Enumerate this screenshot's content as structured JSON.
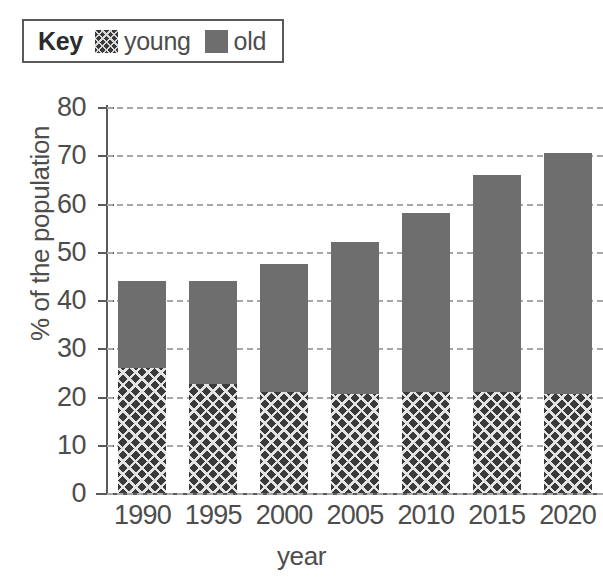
{
  "legend": {
    "title": "Key",
    "entries": [
      {
        "label": "young",
        "swatch": "hatched-swatch",
        "color": "#3a3a3a"
      },
      {
        "label": "old",
        "swatch": "solid-swatch",
        "color": "#6e6e6e"
      }
    ]
  },
  "chart_data": {
    "type": "bar",
    "stacked": true,
    "title": "",
    "xlabel": "year",
    "ylabel": "% of the population",
    "categories": [
      "1990",
      "1995",
      "2000",
      "2005",
      "2010",
      "2015",
      "2020"
    ],
    "series": [
      {
        "name": "young",
        "values": [
          26,
          22.5,
          21,
          20.5,
          21,
          21,
          20.5
        ],
        "color": "#3a3a3a"
      },
      {
        "name": "old",
        "values": [
          18,
          21.5,
          26.5,
          31.5,
          37,
          45,
          50
        ],
        "color": "#6e6e6e"
      }
    ],
    "totals": [
      44,
      44,
      47.5,
      52,
      58,
      66,
      70.5
    ],
    "ylim": [
      0,
      80
    ],
    "yticks": [
      0,
      10,
      20,
      30,
      40,
      50,
      60,
      70,
      80
    ],
    "ytick_labels": [
      "0",
      "10",
      "20",
      "30",
      "40",
      "50",
      "60",
      "70",
      "80"
    ],
    "grid": true,
    "grid_style": "dashed-horizontal",
    "legend_position": "top-left"
  }
}
